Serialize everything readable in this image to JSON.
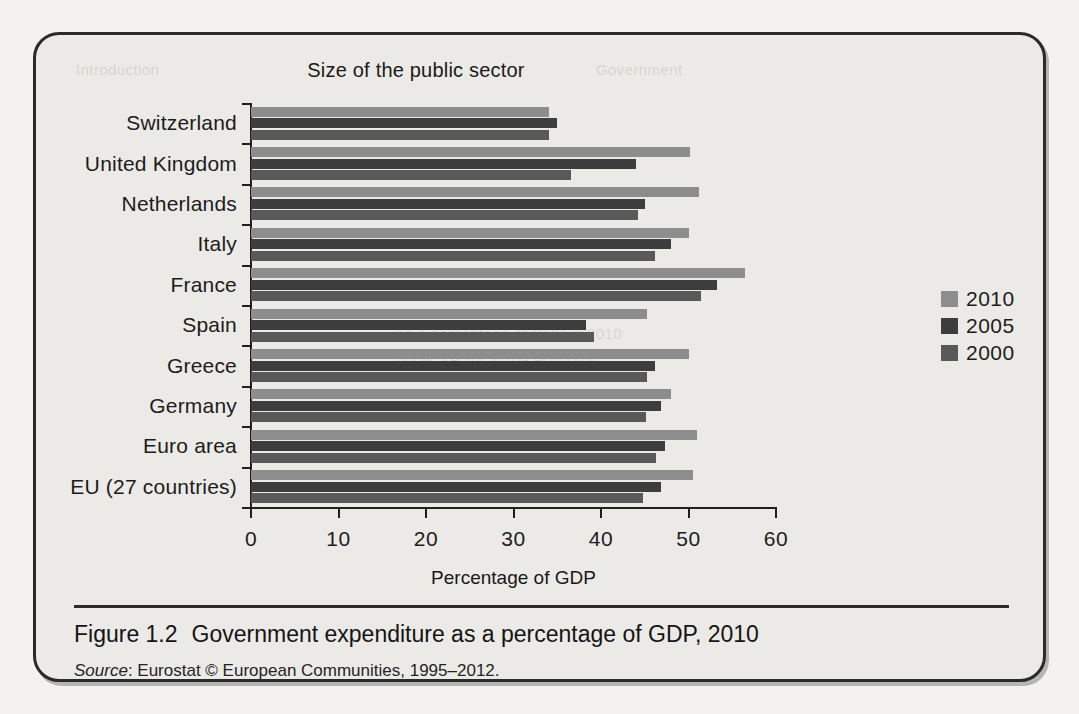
{
  "figure": {
    "caption_label": "Figure 1.2",
    "caption_text": "Government expenditure as a percentage of GDP, 2010",
    "source_label": "Source",
    "source_text": ": Eurostat © European Communities, 1995–2012."
  },
  "ghost_text": {
    "a": "Introduction",
    "b": "Government",
    "c": "as a percentage of GDP in 2010",
    "d": "public sector in the economy"
  },
  "legend": {
    "position": "right",
    "entries": [
      {
        "label": "2010",
        "color": "#8d8d8d"
      },
      {
        "label": "2005",
        "color": "#3d3d3d"
      },
      {
        "label": "2000",
        "color": "#595959"
      }
    ]
  },
  "chart_data": {
    "type": "bar",
    "orientation": "horizontal",
    "title": "Size of the public sector",
    "xlabel": "Percentage of GDP",
    "ylabel": "",
    "xlim": [
      0,
      60
    ],
    "xticks": [
      0,
      10,
      20,
      30,
      40,
      50,
      60
    ],
    "xtick_labels": [
      "0",
      "10",
      "20",
      "30",
      "40",
      "50",
      "60"
    ],
    "grid": false,
    "legend_position": "right",
    "categories": [
      "Switzerland",
      "United Kingdom",
      "Netherlands",
      "Italy",
      "France",
      "Spain",
      "Greece",
      "Germany",
      "Euro area",
      "EU (27 countries)"
    ],
    "series": [
      {
        "name": "2010",
        "color": "#8d8d8d",
        "values": [
          34.0,
          50.2,
          51.2,
          50.0,
          56.5,
          45.3,
          50.1,
          48.0,
          51.0,
          50.5
        ]
      },
      {
        "name": "2005",
        "color": "#3d3d3d",
        "values": [
          35.0,
          44.0,
          45.0,
          48.0,
          53.3,
          38.3,
          46.2,
          46.8,
          47.3,
          46.8
        ]
      },
      {
        "name": "2000",
        "color": "#595959",
        "values": [
          34.0,
          36.6,
          44.2,
          46.2,
          51.4,
          39.2,
          45.3,
          45.1,
          46.3,
          44.8
        ]
      }
    ]
  }
}
